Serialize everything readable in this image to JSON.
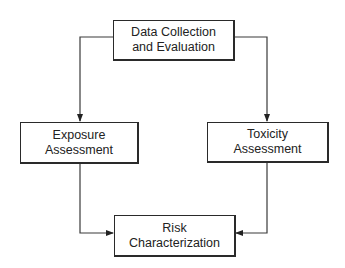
{
  "diagram": {
    "type": "flowchart",
    "nodes": [
      {
        "id": "data",
        "lines": [
          "Data Collection",
          "and Evaluation"
        ]
      },
      {
        "id": "exposure",
        "lines": [
          "Exposure",
          "Assessment"
        ]
      },
      {
        "id": "toxicity",
        "lines": [
          "Toxicity",
          "Assessment"
        ]
      },
      {
        "id": "risk",
        "lines": [
          "Risk",
          "Characterization"
        ]
      }
    ],
    "edges": [
      {
        "from": "data",
        "to": "exposure"
      },
      {
        "from": "data",
        "to": "toxicity"
      },
      {
        "from": "exposure",
        "to": "risk"
      },
      {
        "from": "toxicity",
        "to": "risk"
      }
    ],
    "colors": {
      "line": "#3a3a3a",
      "box_border": "#2a2a2a",
      "text": "#222222",
      "background": "#ffffff"
    }
  }
}
